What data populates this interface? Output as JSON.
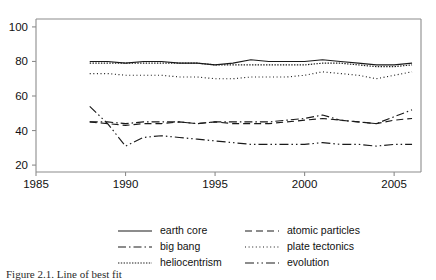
{
  "chart_data": {
    "type": "line",
    "title": "",
    "xlabel": "",
    "ylabel": "",
    "xlim": [
      1985,
      2006.5
    ],
    "ylim": [
      16,
      104
    ],
    "xticks": [
      1985,
      1990,
      1995,
      2000,
      2005
    ],
    "yticks": [
      20,
      40,
      60,
      80,
      100
    ],
    "grid": false,
    "legend_position": "bottom",
    "x": [
      1988,
      1989,
      1990,
      1991,
      1992,
      1993,
      1994,
      1995,
      1996,
      1997,
      1998,
      1999,
      2000,
      2001,
      2002,
      2003,
      2004,
      2005,
      2006
    ],
    "series": [
      {
        "name": "earth core",
        "style": "solid",
        "values": [
          80,
          80,
          79,
          80,
          80,
          79,
          79,
          78,
          79,
          81,
          80,
          80,
          80,
          81,
          80,
          79,
          78,
          78,
          79
        ]
      },
      {
        "name": "atomic particles",
        "style": "dashed",
        "values": [
          45,
          44,
          43,
          44,
          44,
          45,
          44,
          45,
          44,
          44,
          44,
          45,
          46,
          47,
          46,
          45,
          44,
          46,
          47
        ]
      },
      {
        "name": "big bang",
        "style": "dashdot",
        "values": [
          45,
          45,
          44,
          45,
          45,
          45,
          44,
          45,
          45,
          45,
          45,
          46,
          47,
          49,
          46,
          45,
          44,
          48,
          52
        ]
      },
      {
        "name": "plate tectonics",
        "style": "dotted-fine",
        "values": [
          73,
          73,
          72,
          72,
          72,
          71,
          71,
          70,
          70,
          71,
          71,
          71,
          72,
          74,
          73,
          72,
          70,
          72,
          74
        ]
      },
      {
        "name": "heliocentrism",
        "style": "dotted-dense",
        "values": [
          79,
          79,
          79,
          79,
          79,
          79,
          79,
          78,
          78,
          78,
          78,
          78,
          78,
          79,
          79,
          78,
          77,
          77,
          78
        ]
      },
      {
        "name": "evolution",
        "style": "dashdotdot",
        "values": [
          54,
          44,
          31,
          36,
          37,
          36,
          35,
          34,
          33,
          32,
          32,
          32,
          32,
          33,
          32,
          32,
          31,
          32,
          32
        ]
      }
    ]
  },
  "axes": {
    "y_tick_labels": [
      "100",
      "80",
      "60",
      "40",
      "20"
    ],
    "x_tick_labels": [
      "1985",
      "1990",
      "1995",
      "2000",
      "2005"
    ]
  },
  "legend": {
    "entries": [
      {
        "label": "earth core",
        "style": "solid"
      },
      {
        "label": "atomic particles",
        "style": "dashed"
      },
      {
        "label": "big bang",
        "style": "dashdot"
      },
      {
        "label": "plate tectonics",
        "style": "dotted-fine"
      },
      {
        "label": "heliocentrism",
        "style": "dotted-dense"
      },
      {
        "label": "evolution",
        "style": "dashdotdot"
      }
    ]
  },
  "caption": {
    "text": "Figure 2.1. Line of best fit"
  }
}
